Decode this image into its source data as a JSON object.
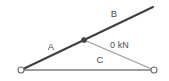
{
  "figure": {
    "type": "truss-force-diagram",
    "background_color": "#ffffff",
    "width": 169,
    "height": 81
  },
  "members": {
    "upper_chord": {
      "label": "B",
      "label_x": 114,
      "label_y": 14,
      "color": "#3f3f3f",
      "stroke_width": 2.0
    },
    "lower_diagonal": {
      "label": "A",
      "label_x": 51,
      "label_y": 47,
      "color": "#3f3f3f",
      "stroke_width": 2.0
    },
    "bottom_chord": {
      "label": "C",
      "label_x": 100,
      "label_y": 60,
      "color": "#7d7d7d",
      "stroke_width": 1.4
    },
    "web_diagonal": {
      "color": "#9a9a9a",
      "stroke_width": 1.1
    }
  },
  "force": {
    "value": "0 kN",
    "label_x": 110,
    "label_y": 46,
    "color": "#4a4a4a"
  },
  "nodes": {
    "left_support": {
      "x": 21,
      "y": 70,
      "r": 3.0
    },
    "right_support": {
      "x": 154,
      "y": 70,
      "r": 3.0
    },
    "joint": {
      "x": 84,
      "y": 40,
      "r": 2.6
    },
    "apex": {
      "x": 153,
      "y": 7
    },
    "support_fill": "#ffffff",
    "support_stroke": "#6e6e6e",
    "joint_fill": "#454545"
  }
}
